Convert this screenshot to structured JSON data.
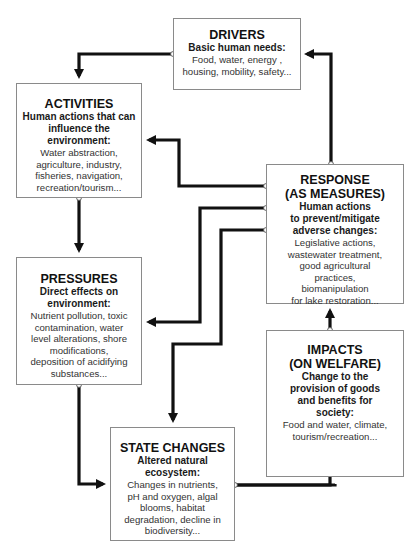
{
  "boxes": {
    "drivers": {
      "title": "DRIVERS",
      "subtitle": "Basic human needs:",
      "lines": [
        "Food, water, energy ,",
        "housing, mobility, safety..."
      ]
    },
    "activities": {
      "title": "ACTIVITIES",
      "subtitle_lines": [
        "Human actions that can",
        "influence the",
        "environment:"
      ],
      "lines": [
        "Water abstraction,",
        "agriculture, industry,",
        "fisheries, navigation,",
        "recreation/tourism..."
      ]
    },
    "response": {
      "title_lines": [
        "RESPONSE",
        "(AS MEASURES)"
      ],
      "subtitle_lines": [
        "Human actions",
        "to prevent/mitigate",
        "adverse changes:"
      ],
      "lines": [
        "Legislative actions,",
        "wastewater treatment,",
        "good agricultural",
        "practices,",
        "biomanipulation",
        "for lake restoration..."
      ]
    },
    "pressures": {
      "title": "PRESSURES",
      "subtitle_lines": [
        "Direct effects on",
        "environment:"
      ],
      "lines": [
        "Nutrient pollution, toxic",
        "contamination, water",
        "level alterations, shore",
        "modifications,",
        "deposition of acidifying",
        "substances..."
      ]
    },
    "impacts": {
      "title_lines": [
        "IMPACTS",
        "(ON WELFARE)"
      ],
      "subtitle_lines": [
        "Change to the",
        "provision of goods",
        "and benefits for",
        "society:"
      ],
      "lines": [
        "Food and water, climate,",
        "tourism/recreation..."
      ]
    },
    "state_changes": {
      "title": "STATE CHANGES",
      "subtitle_lines": [
        "Altered natural",
        "ecosystem:"
      ],
      "lines": [
        "Changes in nutrients,",
        "pH and oxygen, algal",
        "blooms, habitat",
        "degradation, decline in",
        "biodiversity..."
      ]
    }
  },
  "connections": [
    {
      "from": "drivers",
      "to": "activities"
    },
    {
      "from": "activities",
      "to": "pressures"
    },
    {
      "from": "pressures",
      "to": "state_changes"
    },
    {
      "from": "state_changes",
      "to": "impacts"
    },
    {
      "from": "impacts",
      "to": "response"
    },
    {
      "from": "response",
      "to": "drivers"
    },
    {
      "from": "response",
      "to": "activities"
    },
    {
      "from": "response",
      "to": "pressures"
    },
    {
      "from": "response",
      "to": "state_changes"
    }
  ],
  "colors": {
    "arrow": "#111111",
    "box_border": "#8a8a8a",
    "text": "#333333"
  }
}
